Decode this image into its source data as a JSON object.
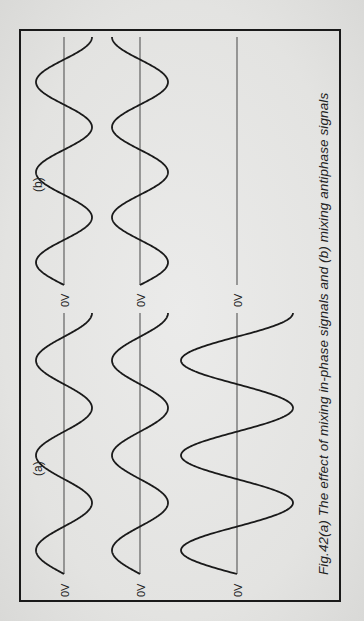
{
  "figure": {
    "caption": "Fig.42(a) The effect of mixing in-phase signals and (b) mixing antiphase signals",
    "panels": [
      {
        "label": "(a)",
        "description": "mixing in-phase signals",
        "traces": [
          {
            "name": "signal-1",
            "baseline_label": "0V",
            "amplitude": 1,
            "phase_deg": 0,
            "cycles": 2.75
          },
          {
            "name": "signal-2",
            "baseline_label": "0V",
            "amplitude": 1,
            "phase_deg": 0,
            "cycles": 2.75
          },
          {
            "name": "sum",
            "baseline_label": "0V",
            "amplitude": 2,
            "phase_deg": 0,
            "cycles": 2.75
          }
        ]
      },
      {
        "label": "(b)",
        "description": "mixing antiphase signals",
        "traces": [
          {
            "name": "signal-1",
            "baseline_label": "0V",
            "amplitude": 1,
            "phase_deg": 0,
            "cycles": 2.75
          },
          {
            "name": "signal-2",
            "baseline_label": "0V",
            "amplitude": 1,
            "phase_deg": 180,
            "cycles": 2.75
          },
          {
            "name": "sum",
            "baseline_label": "0V",
            "amplitude": 0,
            "phase_deg": 0,
            "cycles": 2.75
          }
        ]
      }
    ],
    "colors": {
      "ink": "#1a1a1a",
      "baseline": "#555555",
      "paper": "#e6e6e4"
    }
  }
}
